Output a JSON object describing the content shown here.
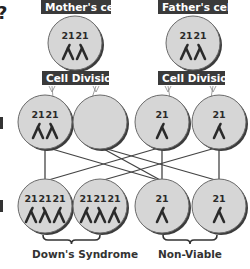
{
  "partial_glyph": "?",
  "colors": {
    "label_bg": "#3a3a3a",
    "cell_fill": "#d6d6d6",
    "cell_stroke": "#6a6a6a",
    "cell_shadow": "#3c3c3c",
    "chromosome": "#2a2a2a",
    "line": "#444444"
  },
  "parents": [
    {
      "label": "Mother's cell",
      "chromosome_labels": [
        "21",
        "21"
      ],
      "division_label": "Cell Division"
    },
    {
      "label": "Father's cell",
      "chromosome_labels": [
        "21",
        "21"
      ],
      "division_label": "Cell Division"
    }
  ],
  "gametes": [
    {
      "chromosome_labels": [
        "21",
        "21"
      ]
    },
    {
      "chromosome_labels": []
    },
    {
      "chromosome_labels": [
        "21"
      ]
    },
    {
      "chromosome_labels": [
        "21"
      ]
    }
  ],
  "zygotes": [
    {
      "chromosome_labels": [
        "21",
        "21",
        "21"
      ]
    },
    {
      "chromosome_labels": [
        "21",
        "21",
        "21"
      ]
    },
    {
      "chromosome_labels": [
        "21"
      ]
    },
    {
      "chromosome_labels": [
        "21"
      ]
    }
  ],
  "connections": [
    {
      "from": 0,
      "to": 0
    },
    {
      "from": 0,
      "to": 2
    },
    {
      "from": 1,
      "to": 3
    },
    {
      "from": 1,
      "to": 2
    },
    {
      "from": 2,
      "to": 0
    },
    {
      "from": 2,
      "to": 2
    },
    {
      "from": 3,
      "to": 1
    },
    {
      "from": 3,
      "to": 3
    }
  ],
  "outcomes": [
    {
      "label": "Down's Syndrome"
    },
    {
      "label": "Non-Viable"
    }
  ]
}
